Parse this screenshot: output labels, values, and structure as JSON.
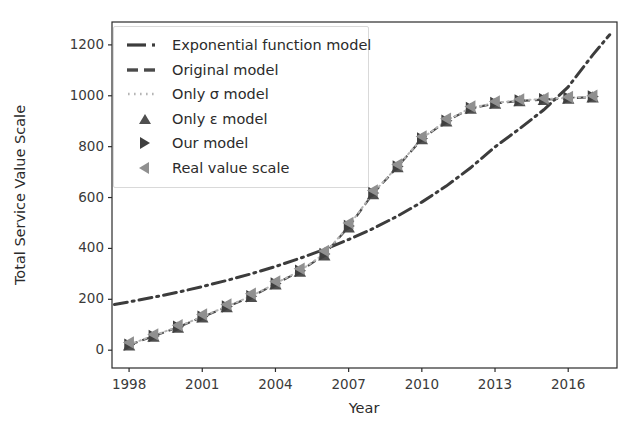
{
  "chart_data": {
    "type": "line",
    "title": "",
    "xlabel": "Year",
    "ylabel": "Total Service Value Scale",
    "xlim": [
      1997.3,
      2018.0
    ],
    "ylim": [
      -70,
      1290
    ],
    "xticks": [
      1998,
      2001,
      2004,
      2007,
      2010,
      2013,
      2016
    ],
    "yticks": [
      0,
      200,
      400,
      600,
      800,
      1000,
      1200
    ],
    "grid": false,
    "legend_position": "upper left",
    "x": [
      1998,
      1999,
      2000,
      2001,
      2002,
      2003,
      2004,
      2005,
      2006,
      2007,
      2008,
      2009,
      2010,
      2011,
      2012,
      2013,
      2014,
      2015,
      2016,
      2017
    ],
    "series": [
      {
        "name": "Exponential function model",
        "style": "dash-dot-line",
        "color": "#3c3c3c",
        "x": [
          1997.4,
          1998,
          1999,
          2000,
          2001,
          2002,
          2003,
          2004,
          2005,
          2006,
          2007,
          2008,
          2009,
          2010,
          2011,
          2012,
          2013,
          2014,
          2015,
          2016,
          2017,
          2017.7
        ],
        "values": [
          180,
          190,
          208,
          228,
          250,
          274,
          300,
          329,
          361,
          396,
          435,
          478,
          527,
          582,
          645,
          717,
          799,
          870,
          945,
          1035,
          1160,
          1240
        ]
      },
      {
        "name": "Original model",
        "style": "dashed-line",
        "color": "#4a4a4a",
        "x": [
          1998,
          1999,
          2000,
          2001,
          2002,
          2003,
          2004,
          2005,
          2006,
          2007,
          2008,
          2009,
          2010,
          2011,
          2012,
          2013,
          2014,
          2015,
          2016,
          2017
        ],
        "values": [
          20,
          55,
          90,
          130,
          170,
          210,
          260,
          310,
          375,
          485,
          615,
          720,
          830,
          900,
          950,
          970,
          980,
          985,
          990,
          995
        ]
      },
      {
        "name": "Only σ model",
        "style": "dotted-line",
        "color": "#b5b5b5",
        "x": [
          1998,
          1999,
          2000,
          2001,
          2002,
          2003,
          2004,
          2005,
          2006,
          2007,
          2008,
          2009,
          2010,
          2011,
          2012,
          2013,
          2014,
          2015,
          2016,
          2017
        ],
        "values": [
          22,
          57,
          92,
          132,
          172,
          212,
          262,
          312,
          378,
          488,
          618,
          722,
          832,
          902,
          952,
          972,
          982,
          987,
          992,
          997
        ]
      },
      {
        "name": "Only ε model",
        "style": "marker-triangle-up",
        "color": "#4f4f4f",
        "x": [
          1998,
          1999,
          2000,
          2001,
          2002,
          2003,
          2004,
          2005,
          2006,
          2007,
          2008,
          2009,
          2010,
          2011,
          2012,
          2013,
          2014,
          2015,
          2016,
          2017
        ],
        "values": [
          18,
          52,
          88,
          128,
          168,
          208,
          258,
          308,
          372,
          482,
          612,
          718,
          828,
          898,
          948,
          968,
          978,
          983,
          988,
          993
        ]
      },
      {
        "name": "Our model",
        "style": "marker-triangle-right",
        "color": "#3f3f3f",
        "x": [
          1998,
          1999,
          2000,
          2001,
          2002,
          2003,
          2004,
          2005,
          2006,
          2007,
          2008,
          2009,
          2010,
          2011,
          2012,
          2013,
          2014,
          2015,
          2016,
          2017
        ],
        "values": [
          22,
          56,
          92,
          132,
          172,
          212,
          262,
          312,
          378,
          488,
          618,
          722,
          832,
          902,
          952,
          972,
          982,
          987,
          992,
          997
        ]
      },
      {
        "name": "Real value scale",
        "style": "marker-triangle-left",
        "color": "#909090",
        "x": [
          1998,
          1999,
          2000,
          2001,
          2002,
          2003,
          2004,
          2005,
          2006,
          2007,
          2008,
          2009,
          2010,
          2011,
          2012,
          2013,
          2014,
          2015,
          2016,
          2017
        ],
        "values": [
          30,
          62,
          98,
          140,
          180,
          222,
          270,
          320,
          390,
          500,
          628,
          730,
          840,
          910,
          958,
          978,
          986,
          990,
          995,
          1000
        ]
      }
    ]
  },
  "axes": {
    "ylabel": "Total Service Value Scale",
    "xlabel": "Year",
    "yticks": [
      "0",
      "200",
      "400",
      "600",
      "800",
      "1000",
      "1200"
    ],
    "xticks": [
      "1998",
      "2001",
      "2004",
      "2007",
      "2010",
      "2013",
      "2016"
    ]
  },
  "legend": {
    "items": [
      {
        "label": "Exponential function model",
        "key": "dash-dot-line"
      },
      {
        "label": "Original model",
        "key": "dashed-line"
      },
      {
        "label": "Only σ model",
        "key": "dotted-line"
      },
      {
        "label": "Only ε model",
        "key": "triangle-up-marker"
      },
      {
        "label": "Our model",
        "key": "triangle-right-marker"
      },
      {
        "label": "Real value scale",
        "key": "triangle-left-marker"
      }
    ]
  },
  "colors": {
    "axis": "#2b2b2b",
    "exponential": "#3c3c3c",
    "original": "#4a4a4a",
    "sigma": "#b5b5b5",
    "epsilon": "#4f4f4f",
    "our": "#3f3f3f",
    "real": "#909090",
    "legend_border": "#d9d9d9",
    "background": "#ffffff"
  }
}
